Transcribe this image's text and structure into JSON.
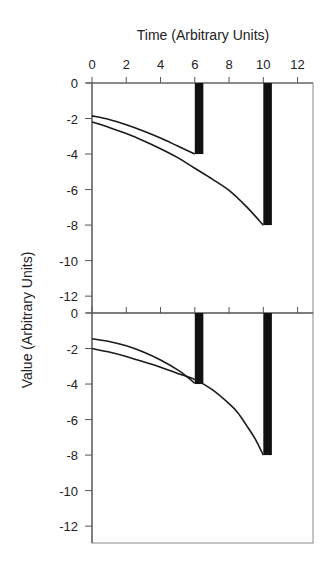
{
  "chart_data": {
    "type": "line",
    "title": "",
    "xlabel": "Time (Arbitrary Units)",
    "ylabel": "Value (Arbitrary Units)",
    "x_axis_position": "top",
    "xlim": [
      0,
      12.9
    ],
    "x_ticks": [
      0,
      2,
      4,
      6,
      8,
      10,
      12
    ],
    "x_tick_labels": [
      "0",
      "2",
      "4",
      "6",
      "8",
      "10",
      "12"
    ],
    "grid": false,
    "legend": null,
    "panels": [
      {
        "name": "top-panel",
        "ylim": [
          -12.95,
          0
        ],
        "y_ticks": [
          0,
          -2,
          -4,
          -6,
          -8,
          -10,
          -12
        ],
        "y_tick_labels": [
          "0",
          "-2",
          "-4",
          "-6",
          "-8",
          "-10",
          "-12"
        ],
        "bars": [
          {
            "x_start": 6.0,
            "x_end": 6.5,
            "y_start": 0,
            "y_end": -4
          },
          {
            "x_start": 10.0,
            "x_end": 10.5,
            "y_start": 0,
            "y_end": -8
          }
        ],
        "series": [
          {
            "name": "curve-1",
            "x": [
              0,
              1,
              2,
              3,
              4,
              5,
              6
            ],
            "y": [
              -1.85,
              -2.05,
              -2.35,
              -2.7,
              -3.1,
              -3.55,
              -4.0
            ]
          },
          {
            "name": "curve-2",
            "x": [
              0,
              1,
              2,
              3,
              4,
              5,
              6,
              7,
              8,
              9,
              10
            ],
            "y": [
              -2.2,
              -2.5,
              -2.85,
              -3.25,
              -3.7,
              -4.2,
              -4.8,
              -5.4,
              -6.05,
              -6.95,
              -8.0
            ]
          }
        ]
      },
      {
        "name": "bottom-panel",
        "ylim": [
          -12.95,
          0
        ],
        "y_ticks": [
          0,
          -2,
          -4,
          -6,
          -8,
          -10,
          -12
        ],
        "y_tick_labels": [
          "0",
          "-2",
          "-4",
          "-6",
          "-8",
          "-10",
          "-12"
        ],
        "bars": [
          {
            "x_start": 6.0,
            "x_end": 6.5,
            "y_start": 0,
            "y_end": -4
          },
          {
            "x_start": 10.0,
            "x_end": 10.5,
            "y_start": 0,
            "y_end": -8
          }
        ],
        "series": [
          {
            "name": "curve-1",
            "x": [
              0,
              1,
              2,
              3,
              4,
              5,
              5.5,
              6
            ],
            "y": [
              -1.45,
              -1.6,
              -1.85,
              -2.2,
              -2.65,
              -3.2,
              -3.55,
              -3.95
            ]
          },
          {
            "name": "curve-2",
            "x": [
              0,
              1,
              2,
              3,
              4,
              5,
              6,
              7,
              8,
              8.5,
              9,
              9.5,
              10
            ],
            "y": [
              -2.0,
              -2.2,
              -2.45,
              -2.75,
              -3.05,
              -3.4,
              -3.75,
              -4.3,
              -5.1,
              -5.6,
              -6.3,
              -7.05,
              -8.0
            ]
          }
        ]
      }
    ]
  },
  "colors": {
    "line": "#1a1a1a",
    "bar": "#111111",
    "axis": "#555555",
    "frame": "#888888",
    "background": "#ffffff"
  }
}
